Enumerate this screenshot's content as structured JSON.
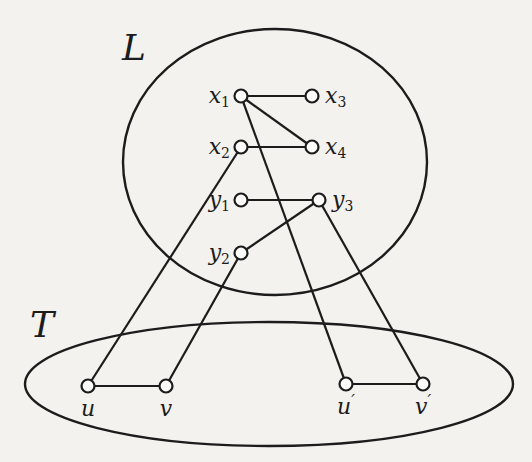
{
  "figure": {
    "regions": [
      {
        "id": "L",
        "label": "L",
        "shape": "circle"
      },
      {
        "id": "T",
        "label": "T",
        "shape": "ellipse"
      }
    ],
    "nodes": [
      {
        "id": "x1",
        "base": "x",
        "sub": "1",
        "region": "L"
      },
      {
        "id": "x2",
        "base": "x",
        "sub": "2",
        "region": "L"
      },
      {
        "id": "x3",
        "base": "x",
        "sub": "3",
        "region": "L"
      },
      {
        "id": "x4",
        "base": "x",
        "sub": "4",
        "region": "L"
      },
      {
        "id": "y1",
        "base": "y",
        "sub": "1",
        "region": "L"
      },
      {
        "id": "y2",
        "base": "y",
        "sub": "2",
        "region": "L"
      },
      {
        "id": "y3",
        "base": "y",
        "sub": "3",
        "region": "L"
      },
      {
        "id": "u",
        "base": "u",
        "sub": "",
        "prime": false,
        "region": "T"
      },
      {
        "id": "v",
        "base": "v",
        "sub": "",
        "prime": false,
        "region": "T"
      },
      {
        "id": "u'",
        "base": "u",
        "sub": "",
        "prime": true,
        "region": "T"
      },
      {
        "id": "v'",
        "base": "v",
        "sub": "",
        "prime": true,
        "region": "T"
      }
    ],
    "edges": [
      [
        "x1",
        "x3"
      ],
      [
        "x1",
        "x4"
      ],
      [
        "x2",
        "x4"
      ],
      [
        "y1",
        "y3"
      ],
      [
        "y2",
        "y3"
      ],
      [
        "x1",
        "u'"
      ],
      [
        "x2",
        "u"
      ],
      [
        "y2",
        "v"
      ],
      [
        "y3",
        "v'"
      ],
      [
        "u",
        "v"
      ],
      [
        "u'",
        "v'"
      ]
    ]
  }
}
